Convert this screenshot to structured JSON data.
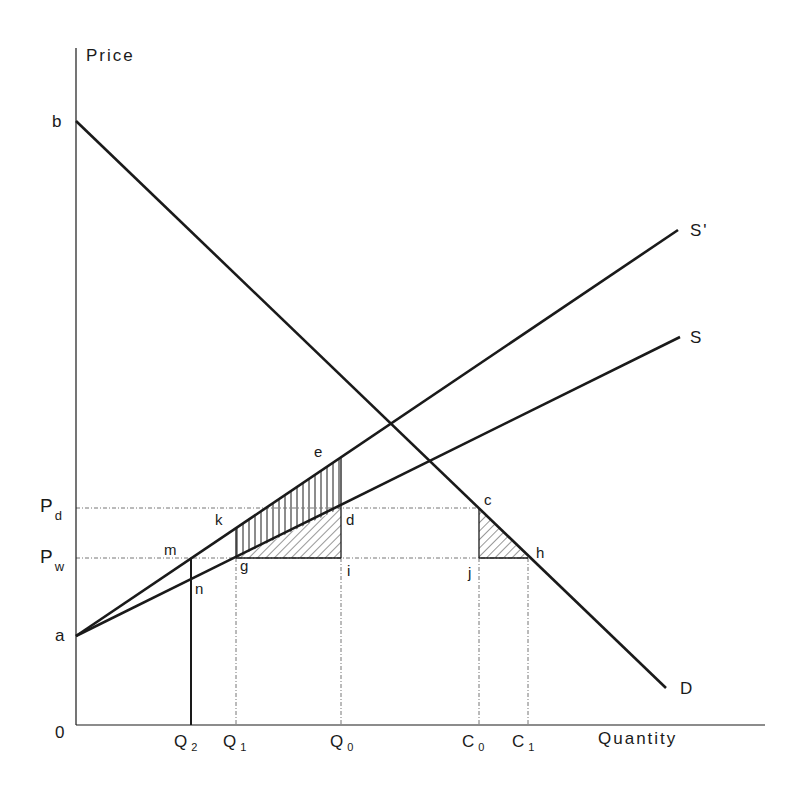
{
  "diagram": {
    "axes": {
      "y_label": "Price",
      "x_label": "Quantity",
      "origin_label": "0"
    },
    "curves": {
      "demand": {
        "label": "D",
        "from_label": "b"
      },
      "supply": {
        "label": "S",
        "from_label": "a"
      },
      "supply_shifted": {
        "label": "S'"
      }
    },
    "price_levels": [
      {
        "main": "P",
        "sub": "d"
      },
      {
        "main": "P",
        "sub": "w"
      }
    ],
    "quantity_ticks": [
      {
        "main": "Q",
        "sub": "2"
      },
      {
        "main": "Q",
        "sub": "1"
      },
      {
        "main": "Q",
        "sub": "0"
      },
      {
        "main": "C",
        "sub": "0"
      },
      {
        "main": "C",
        "sub": "1"
      }
    ],
    "points": {
      "e": "e",
      "k": "k",
      "d": "d",
      "m": "m",
      "g": "g",
      "i": "i",
      "n": "n",
      "c": "c",
      "j": "j",
      "h": "h"
    },
    "shaded_regions": [
      {
        "name": "kedg",
        "pattern": "vertical-hatch"
      },
      {
        "name": "gdi",
        "pattern": "diagonal-hatch"
      },
      {
        "name": "cjh",
        "pattern": "diagonal-hatch"
      }
    ],
    "colors": {
      "line": "#1a1a1a",
      "guide": "#777777"
    }
  }
}
